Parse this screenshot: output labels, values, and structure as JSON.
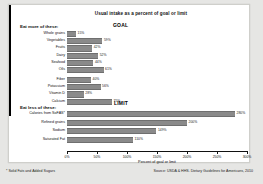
{
  "chart_data": {
    "type": "bar",
    "title": "Usual intake as a percent of goal or limit",
    "xlabel": "Percent of goal or limit",
    "ylabel": "",
    "xlim": [
      0,
      300
    ],
    "xticks": [
      0,
      50,
      100,
      150,
      200,
      250,
      300
    ],
    "xticklabels": [
      "0%",
      "50%",
      "100%",
      "150%",
      "200%",
      "250%",
      "300%"
    ],
    "grid": false,
    "legend": "none",
    "orientation": "horizontal",
    "reference_lines": [
      {
        "label": "GOAL",
        "value": 100,
        "group": "eat-more"
      },
      {
        "label": "LIMIT",
        "value": 100,
        "group": "eat-less"
      }
    ],
    "groups": [
      {
        "id": "eat-more",
        "heading": "Eat more of these:",
        "categories": [
          "Whole grains",
          "Vegetables",
          "Fruits",
          "Dairy",
          "Seafood",
          "Oils",
          "Fiber",
          "Potassium",
          "Vitamin D",
          "Calcium"
        ],
        "values": [
          15,
          59,
          42,
          52,
          44,
          61,
          40,
          56,
          28,
          75
        ],
        "labels": [
          "15%",
          "59%",
          "42%",
          "52%",
          "44%",
          "61%",
          "40%",
          "56%",
          "28%",
          "75%"
        ]
      },
      {
        "id": "eat-less",
        "heading": "Eat less of these:",
        "categories": [
          "Calories from SoFAS*",
          "Refined grains",
          "Sodium",
          "Saturated Fat"
        ],
        "values": [
          280,
          200,
          149,
          110
        ],
        "labels": [
          "280%",
          "200%",
          "149%",
          "110%"
        ]
      }
    ]
  },
  "footer": {
    "footnote": "* Solid Fats and Added Sugars",
    "source": "Source: USDA & HHS. Dietary Guidelines for Americans, 2010"
  },
  "colors": {
    "bar": "#8a8a8a",
    "reference_line": "#000000",
    "panel": "#ffffff",
    "page": "#e6e6e4"
  }
}
